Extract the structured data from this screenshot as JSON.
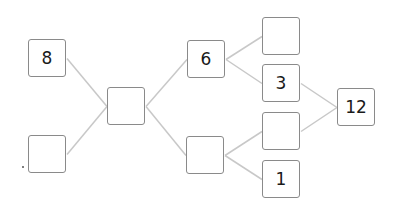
{
  "diagram": {
    "type": "number-bond-tree",
    "line_color": "#c8c8c8",
    "box_border_color": "#8a8a8a",
    "nodes": [
      {
        "id": "a",
        "value": "8",
        "x": 28,
        "y": 39
      },
      {
        "id": "b",
        "value": "",
        "x": 28,
        "y": 135
      },
      {
        "id": "c",
        "value": "",
        "x": 107,
        "y": 87
      },
      {
        "id": "d",
        "value": "6",
        "x": 187,
        "y": 40
      },
      {
        "id": "e",
        "value": "",
        "x": 186,
        "y": 136
      },
      {
        "id": "f",
        "value": "",
        "x": 262,
        "y": 17
      },
      {
        "id": "g",
        "value": "3",
        "x": 262,
        "y": 64
      },
      {
        "id": "h",
        "value": "",
        "x": 262,
        "y": 112
      },
      {
        "id": "i",
        "value": "1",
        "x": 262,
        "y": 160
      },
      {
        "id": "j",
        "value": "12",
        "x": 337,
        "y": 88
      }
    ],
    "edges": [
      [
        "a",
        "c"
      ],
      [
        "b",
        "c"
      ],
      [
        "c",
        "d"
      ],
      [
        "c",
        "e"
      ],
      [
        "d",
        "f"
      ],
      [
        "d",
        "g"
      ],
      [
        "e",
        "h"
      ],
      [
        "e",
        "i"
      ],
      [
        "g",
        "j"
      ],
      [
        "h",
        "j"
      ]
    ]
  }
}
